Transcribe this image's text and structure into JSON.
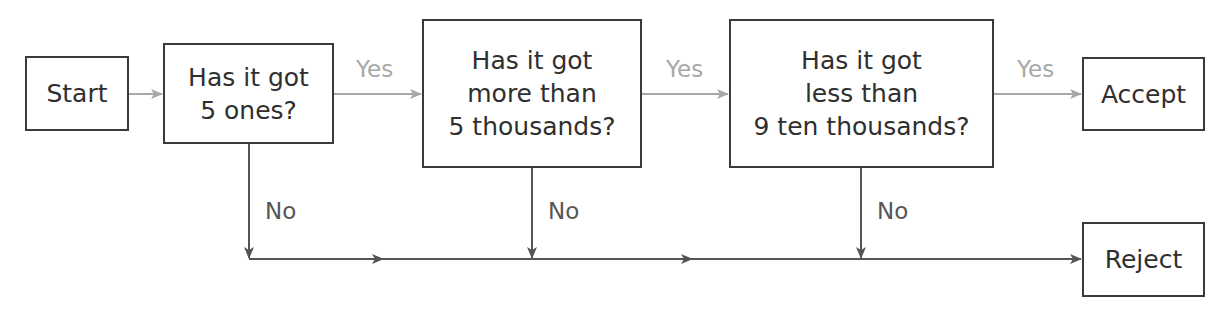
{
  "diagram": {
    "type": "flowchart",
    "colors": {
      "box_border": "#3a3a3a",
      "yes_arrow": "#a8a8a8",
      "no_arrow": "#555555",
      "text": "#2f2f2f"
    },
    "nodes": {
      "start": {
        "lines": [
          "Start"
        ]
      },
      "q1": {
        "lines": [
          "Has it got",
          "5 ones?"
        ]
      },
      "q2": {
        "lines": [
          "Has it got",
          "more than",
          "5 thousands?"
        ]
      },
      "q3": {
        "lines": [
          "Has it got",
          "less than",
          "9 ten thousands?"
        ]
      },
      "accept": {
        "lines": [
          "Accept"
        ]
      },
      "reject": {
        "lines": [
          "Reject"
        ]
      }
    },
    "edges": {
      "q1_yes": "Yes",
      "q2_yes": "Yes",
      "q3_yes": "Yes",
      "q1_no": "No",
      "q2_no": "No",
      "q3_no": "No"
    }
  }
}
